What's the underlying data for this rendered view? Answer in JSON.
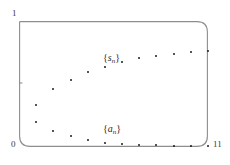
{
  "figure": {
    "background_color": "#ffffff",
    "ink_color": "#1c1c1c",
    "axis_color": "#8a8a8a"
  },
  "axes": {
    "y_max_label": "1",
    "origin_label": "0",
    "x_max_label": "11",
    "y_tick_label": ""
  },
  "annotations": {
    "upper_series_open": "{",
    "upper_series_symbol": "s",
    "upper_series_index": "n",
    "upper_series_close": "}",
    "lower_series_open": "{",
    "lower_series_symbol": "a",
    "lower_series_index": "n",
    "lower_series_close": "}"
  },
  "chart_data": {
    "type": "scatter",
    "title": "",
    "xlabel": "",
    "ylabel": "",
    "xlim": [
      0,
      11
    ],
    "ylim": [
      0,
      1
    ],
    "grid": false,
    "legend": "inline-annotation",
    "x": [
      1,
      2,
      3,
      4,
      5,
      6,
      7,
      8,
      9,
      10,
      11
    ],
    "series": [
      {
        "name": "{s_n}",
        "label_x": 6.0,
        "label_y": 0.64,
        "values": [
          0.33,
          0.46,
          0.535,
          0.595,
          0.635,
          0.675,
          0.705,
          0.725,
          0.74,
          0.755,
          0.765
        ]
      },
      {
        "name": "{a_n}",
        "label_x": 6.0,
        "label_y": 0.075,
        "values": [
          0.195,
          0.125,
          0.085,
          0.055,
          0.035,
          0.025,
          0.018,
          0.013,
          0.01,
          0.008,
          0.006
        ]
      }
    ]
  }
}
